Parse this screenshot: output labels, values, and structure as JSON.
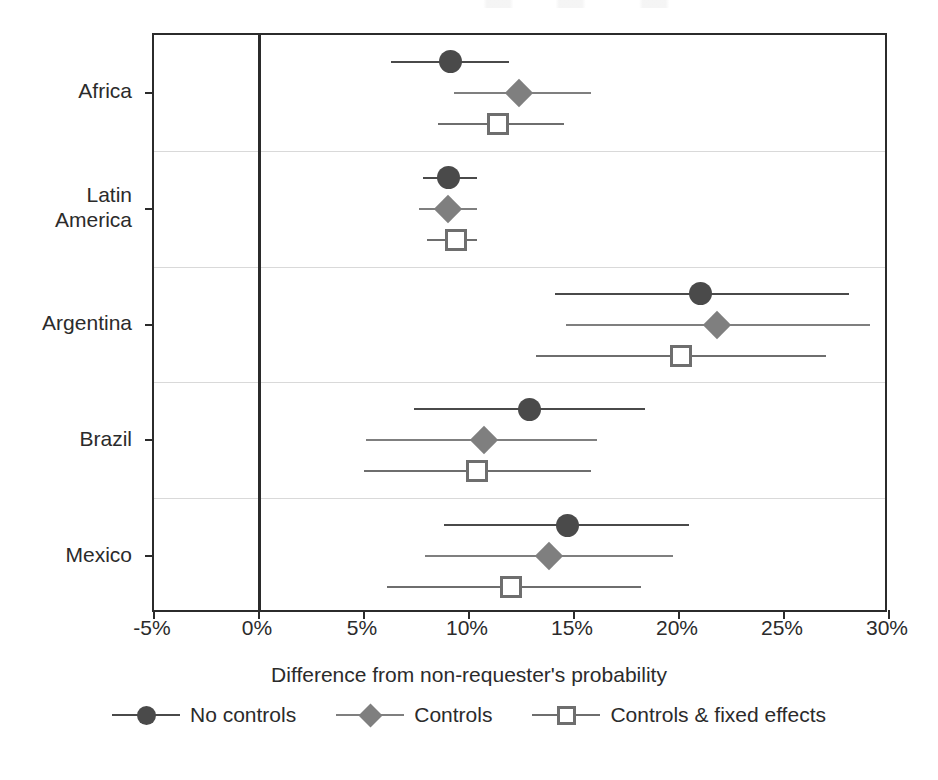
{
  "chart_data": {
    "type": "scatter",
    "subtype": "coefficient-plot-with-confidence-intervals",
    "title": "",
    "xlabel": "Difference from non-requester's probability",
    "ylabel": "",
    "xlim": [
      -5,
      30
    ],
    "xticks": [
      -5,
      0,
      5,
      10,
      15,
      20,
      25,
      30
    ],
    "xticklabels": [
      "-5%",
      "0%",
      "5%",
      "10%",
      "15%",
      "20%",
      "25%",
      "30%"
    ],
    "categories": [
      "Africa",
      "Latin\nAmerica",
      "Argentina",
      "Brazil",
      "Mexico"
    ],
    "grid": "horizontal-between-categories",
    "reference_line": 0,
    "legend_position": "bottom",
    "series": [
      {
        "name": "No controls",
        "marker": "circle",
        "color": "#4a4a4a",
        "values": [
          9.1,
          9.0,
          21.0,
          12.9,
          14.7
        ],
        "ci_low": [
          6.3,
          7.8,
          14.1,
          7.4,
          8.8
        ],
        "ci_high": [
          11.9,
          10.4,
          28.1,
          18.4,
          20.5
        ]
      },
      {
        "name": "Controls",
        "marker": "diamond",
        "color": "#7f7f7f",
        "values": [
          12.4,
          9.0,
          21.8,
          10.7,
          13.8
        ],
        "ci_low": [
          9.3,
          7.6,
          14.6,
          5.1,
          7.9
        ],
        "ci_high": [
          15.8,
          10.4,
          29.1,
          16.1,
          19.7
        ]
      },
      {
        "name": "Controls & fixed effects",
        "marker": "square-open",
        "color": "#6e6e6e",
        "values": [
          11.4,
          9.4,
          20.1,
          10.4,
          12.0
        ],
        "ci_low": [
          8.5,
          8.0,
          13.2,
          5.0,
          6.1
        ],
        "ci_high": [
          14.5,
          10.4,
          27.0,
          15.8,
          18.2
        ]
      }
    ]
  },
  "axis": {
    "x_title": "Difference from non-requester's probability",
    "x_tick_labels": [
      "-5%",
      "0%",
      "5%",
      "10%",
      "15%",
      "20%",
      "25%",
      "30%"
    ],
    "y_tick_labels": [
      "Africa",
      "Latin\nAmerica",
      "Argentina",
      "Brazil",
      "Mexico"
    ]
  },
  "legend": {
    "items": [
      {
        "label": "No controls",
        "marker": "circle",
        "color": "#4a4a4a"
      },
      {
        "label": "Controls",
        "marker": "diamond",
        "color": "#7f7f7f"
      },
      {
        "label": "Controls & fixed effects",
        "marker": "square-open",
        "color": "#6e6e6e"
      }
    ]
  },
  "colors": {
    "axis": "#2b2b2b",
    "gridline": "#d9d9d9",
    "no_controls": "#4a4a4a",
    "controls": "#7f7f7f",
    "controls_fixed_effects": "#6e6e6e",
    "background": "#ffffff"
  }
}
